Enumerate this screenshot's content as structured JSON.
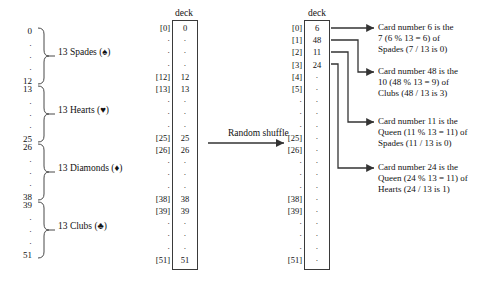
{
  "suit_ranges": [
    {
      "start": "0",
      "end": "12",
      "label": "13 Spades (♠)",
      "suit_icon": "spade-icon"
    },
    {
      "start": "13",
      "end": "25",
      "label": "13 Hearts (♥)",
      "suit_icon": "heart-icon"
    },
    {
      "start": "26",
      "end": "38",
      "label": "13 Diamonds (♦)",
      "suit_icon": "diamond-icon"
    },
    {
      "start": "39",
      "end": "51",
      "label": "13 Clubs (♣)",
      "suit_icon": "club-icon"
    }
  ],
  "sorted_deck": {
    "title": "deck",
    "rows": [
      {
        "index": "[0]",
        "value": "0"
      },
      {
        "index": "·",
        "value": "·"
      },
      {
        "index": "·",
        "value": "·"
      },
      {
        "index": "·",
        "value": "·"
      },
      {
        "index": "[12]",
        "value": "12"
      },
      {
        "index": "[13]",
        "value": "13"
      },
      {
        "index": "·",
        "value": "·"
      },
      {
        "index": "·",
        "value": "·"
      },
      {
        "index": "·",
        "value": "·"
      },
      {
        "index": "[25]",
        "value": "25"
      },
      {
        "index": "[26]",
        "value": "26"
      },
      {
        "index": "·",
        "value": "·"
      },
      {
        "index": "·",
        "value": "·"
      },
      {
        "index": "·",
        "value": "·"
      },
      {
        "index": "[38]",
        "value": "38"
      },
      {
        "index": "[39]",
        "value": "39"
      },
      {
        "index": "·",
        "value": "·"
      },
      {
        "index": "·",
        "value": "·"
      },
      {
        "index": "·",
        "value": "·"
      },
      {
        "index": "[51]",
        "value": "51"
      }
    ]
  },
  "shuffled_deck": {
    "title": "deck",
    "rows": [
      {
        "index": "[0]",
        "value": "6"
      },
      {
        "index": "[1]",
        "value": "48"
      },
      {
        "index": "[2]",
        "value": "11"
      },
      {
        "index": "[3]",
        "value": "24"
      },
      {
        "index": "[4]",
        "value": "·"
      },
      {
        "index": "[5]",
        "value": "·"
      },
      {
        "index": "·",
        "value": "·"
      },
      {
        "index": "·",
        "value": "·"
      },
      {
        "index": "·",
        "value": "·"
      },
      {
        "index": "[25]",
        "value": "·"
      },
      {
        "index": "[26]",
        "value": "·"
      },
      {
        "index": "·",
        "value": "·"
      },
      {
        "index": "·",
        "value": "·"
      },
      {
        "index": "·",
        "value": "·"
      },
      {
        "index": "[38]",
        "value": "·"
      },
      {
        "index": "[39]",
        "value": "·"
      },
      {
        "index": "·",
        "value": "·"
      },
      {
        "index": "·",
        "value": "·"
      },
      {
        "index": "·",
        "value": "·"
      },
      {
        "index": "[51]",
        "value": "·"
      }
    ]
  },
  "transform": {
    "label": "Random shuffle"
  },
  "annotations": [
    {
      "line1": "Card number 6 is the",
      "line2": "7 (6 % 13 = 6) of",
      "line3": "Spades (7 / 13 is 0)"
    },
    {
      "line1": "Card number 48 is the",
      "line2": "10 (48 % 13 = 9) of",
      "line3": "Clubs (48 / 13 is 3)"
    },
    {
      "line1": "Card number 11 is the",
      "line2": "Queen (11 % 13 = 11) of",
      "line3": "Spades (11 / 13 is 0)"
    },
    {
      "line1": "Card number 24 is the",
      "line2": "Queen (24 % 13 = 11) of",
      "line3": "Hearts (24 / 13 is 1)"
    }
  ],
  "colors": {
    "stroke": "#3a3a3a",
    "text": "#111111",
    "background": "#ffffff"
  }
}
